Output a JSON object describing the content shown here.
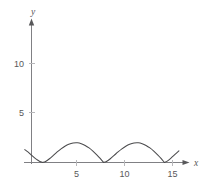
{
  "figure": {
    "background_color": "#ffffff",
    "axis_color": "#808084",
    "curve_color": "#4a4a4c",
    "text_color": "#58585a"
  },
  "axes": {
    "x_label": "x",
    "y_label": "y",
    "x_ticks": [
      {
        "value": 5,
        "label": "5"
      },
      {
        "value": 10,
        "label": "10"
      },
      {
        "value": 15,
        "label": "15"
      }
    ],
    "y_ticks": [
      {
        "value": 5,
        "label": "5"
      },
      {
        "value": 10,
        "label": "10"
      }
    ]
  },
  "chart_data": {
    "type": "line",
    "title": "",
    "xlabel": "x",
    "ylabel": "y",
    "grid": false,
    "legend": null,
    "xlim": [
      -0.4,
      16.2
    ],
    "ylim": [
      0,
      13.2
    ],
    "xticks": [
      5,
      10,
      15
    ],
    "yticks": [
      5,
      10
    ],
    "series": [
      {
        "name": "arches",
        "cusps_x": [
          1.5,
          7.8,
          14.1
        ],
        "arch_period": 6.3,
        "arch_peak_y": 2.0,
        "x": [
          -0.35,
          0.0,
          0.3,
          0.6,
          0.9,
          1.2,
          1.5,
          1.8,
          2.2,
          2.6,
          3.0,
          3.4,
          3.8,
          4.2,
          4.65,
          5.1,
          5.5,
          5.9,
          6.3,
          6.7,
          7.1,
          7.45,
          7.8,
          8.1,
          8.5,
          8.9,
          9.3,
          9.7,
          10.1,
          10.5,
          10.95,
          11.4,
          11.8,
          12.2,
          12.6,
          13.0,
          13.4,
          13.75,
          14.1,
          14.4,
          14.8,
          15.2,
          15.6
        ],
        "y": [
          1.3,
          1.05,
          0.78,
          0.52,
          0.29,
          0.1,
          0.0,
          0.1,
          0.38,
          0.72,
          1.07,
          1.38,
          1.64,
          1.84,
          1.97,
          1.99,
          1.9,
          1.72,
          1.47,
          1.15,
          0.78,
          0.42,
          0.0,
          0.1,
          0.38,
          0.72,
          1.07,
          1.38,
          1.64,
          1.84,
          1.97,
          1.99,
          1.9,
          1.72,
          1.47,
          1.15,
          0.78,
          0.42,
          0.0,
          0.14,
          0.46,
          0.82,
          1.18
        ]
      }
    ]
  }
}
